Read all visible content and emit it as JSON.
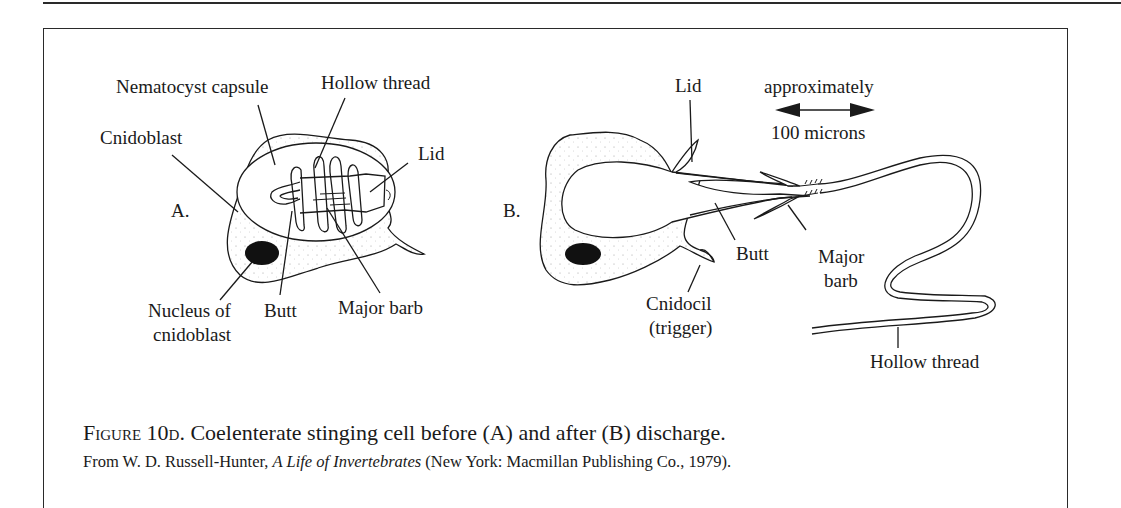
{
  "figure": {
    "caption_label": "Figure 10d.",
    "caption_text": "Coelenterate stinging cell before (A) and after (B) discharge.",
    "source_prefix": "From W. D. Russell-Hunter, ",
    "source_title": "A Life of Invertebrates",
    "source_suffix": " (New York: Macmillan Publishing Co., 1979)."
  },
  "panel_a": {
    "letter": "A.",
    "labels": {
      "nematocyst_capsule": "Nematocyst capsule",
      "hollow_thread": "Hollow thread",
      "cnidoblast": "Cnidoblast",
      "lid": "Lid",
      "nucleus_line1": "Nucleus of",
      "nucleus_line2": "cnidoblast",
      "butt": "Butt",
      "major_barb": "Major barb"
    }
  },
  "panel_b": {
    "letter": "B.",
    "labels": {
      "lid": "Lid",
      "scale_top": "approximately",
      "scale_bottom": "100 microns",
      "butt": "Butt",
      "major_line1": "Major",
      "major_line2": "barb",
      "cnidocil_line1": "Cnidocil",
      "cnidocil_line2": "(trigger)",
      "hollow_thread": "Hollow thread"
    }
  },
  "colors": {
    "ink": "#1a1a1a",
    "paper": "#ffffff",
    "nucleus": "#111111"
  }
}
